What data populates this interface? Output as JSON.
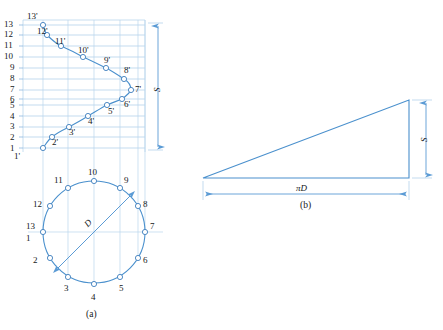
{
  "figure": {
    "title_a": "(a)",
    "title_b": "(b)",
    "colors": {
      "line": "#5b9bd5",
      "thin_line": "#9cc3e5",
      "dim_line": "#6aa3d8",
      "text": "#15181a",
      "marker_fill": "#ffffff"
    }
  },
  "front_view": {
    "name": "front-view-developed-curve",
    "axis_numbers": [
      "1",
      "2",
      "3",
      "4",
      "5",
      "6",
      "7",
      "8",
      "9",
      "10",
      "11",
      "12",
      "13"
    ],
    "point_labels": [
      "1'",
      "2'",
      "3'",
      "4'",
      "5'",
      "6'",
      "7'",
      "8'",
      "9'",
      "10'",
      "11'",
      "12'",
      "13'"
    ],
    "points": [
      {
        "label": "1'",
        "x": 43,
        "y": 148
      },
      {
        "label": "2'",
        "x": 52,
        "y": 137
      },
      {
        "label": "3'",
        "x": 69,
        "y": 127
      },
      {
        "label": "4'",
        "x": 88,
        "y": 116
      },
      {
        "label": "5'",
        "x": 107,
        "y": 105
      },
      {
        "label": "6'",
        "x": 122,
        "y": 99
      },
      {
        "label": "7'",
        "x": 131,
        "y": 90
      },
      {
        "label": "8'",
        "x": 124,
        "y": 79
      },
      {
        "label": "9'",
        "x": 106,
        "y": 68
      },
      {
        "label": "10'",
        "x": 83,
        "y": 57
      },
      {
        "label": "11'",
        "x": 61,
        "y": 46
      },
      {
        "label": "12'",
        "x": 47,
        "y": 35
      },
      {
        "label": "13'",
        "x": 43,
        "y": 25
      }
    ],
    "dimension": {
      "label": "S",
      "name": "dimension-s-front"
    }
  },
  "bottom_view": {
    "name": "bottom-view-circle",
    "diameter_label": "D",
    "point_labels": [
      "1",
      "2",
      "3",
      "4",
      "5",
      "6",
      "7",
      "8",
      "9",
      "10",
      "11",
      "12",
      "13"
    ],
    "circle": {
      "cx": 94,
      "cy": 232,
      "r": 51
    },
    "points": [
      {
        "label": "1",
        "x": 43,
        "y": 232,
        "tx": 29,
        "ty": 236
      },
      {
        "label": "2",
        "x": 50,
        "y": 258,
        "tx": 33,
        "ty": 258
      },
      {
        "label": "3",
        "x": 68,
        "y": 277,
        "tx": 63,
        "ty": 288
      },
      {
        "label": "4",
        "x": 94,
        "y": 284,
        "tx": 90,
        "ty": 295
      },
      {
        "label": "5",
        "x": 120,
        "y": 277,
        "tx": 119,
        "ty": 288
      },
      {
        "label": "6",
        "x": 138,
        "y": 258,
        "tx": 143,
        "ty": 259
      },
      {
        "label": "7",
        "x": 145,
        "y": 232,
        "tx": 150,
        "ty": 225
      },
      {
        "label": "8",
        "x": 138,
        "y": 206,
        "tx": 143,
        "ty": 202
      },
      {
        "label": "9",
        "x": 120,
        "y": 188,
        "tx": 123,
        "ty": 178
      },
      {
        "label": "10",
        "x": 94,
        "y": 181,
        "tx": 88,
        "ty": 170
      },
      {
        "label": "11",
        "x": 68,
        "y": 188,
        "tx": 54,
        "ty": 178
      },
      {
        "label": "12",
        "x": 50,
        "y": 206,
        "tx": 33,
        "ty": 202
      },
      {
        "label": "13",
        "x": 43,
        "y": 232,
        "tx": 27,
        "ty": 224
      }
    ]
  },
  "development": {
    "name": "development-triangle",
    "side_label": "S",
    "base_label": "πD",
    "vertices": {
      "left": [
        203,
        178
      ],
      "right_bottom": [
        409,
        178
      ],
      "right_top": [
        409,
        100
      ]
    }
  }
}
